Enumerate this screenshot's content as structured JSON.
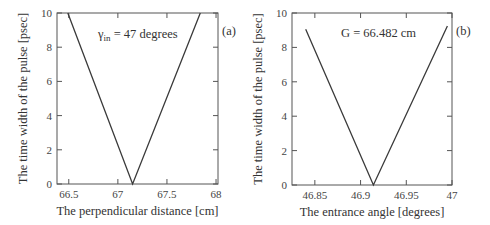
{
  "chart_data": [
    {
      "type": "line",
      "panel_label": "(a)",
      "title": "",
      "annotation": {
        "symbol": "γ",
        "subscript": "in",
        "text": " = 47 degrees"
      },
      "xlabel": "The perpendicular distance [cm]",
      "ylabel": "The time width of the pulse [psec]",
      "xlim": [
        66.38,
        68.02
      ],
      "ylim": [
        0,
        10
      ],
      "xticks": [
        66.5,
        67,
        67.5,
        68
      ],
      "xtick_labels": [
        "66.5",
        "67",
        "67.5",
        "68"
      ],
      "yticks": [
        0,
        2,
        4,
        6,
        8,
        10
      ],
      "ytick_labels": [
        "0",
        "2",
        "4",
        "6",
        "8",
        "10"
      ],
      "grid": false,
      "series": [
        {
          "name": "pulse width",
          "x": [
            66.49,
            67.15,
            67.84
          ],
          "y": [
            10,
            0,
            10
          ]
        }
      ]
    },
    {
      "type": "line",
      "panel_label": "(b)",
      "title": "",
      "annotation": {
        "text": "G = 66.482 cm"
      },
      "xlabel": "The entrance angle [degrees]",
      "ylabel": "The time width of the pulse [psec]",
      "xlim": [
        46.825,
        47.0
      ],
      "ylim": [
        0,
        10
      ],
      "xticks": [
        46.85,
        46.9,
        46.95,
        47
      ],
      "xtick_labels": [
        "46.85",
        "46.9",
        "46.95",
        "47"
      ],
      "yticks": [
        0,
        2,
        4,
        6,
        8,
        10
      ],
      "ytick_labels": [
        "0",
        "2",
        "4",
        "6",
        "8",
        "10"
      ],
      "grid": false,
      "series": [
        {
          "name": "pulse width",
          "x": [
            46.84,
            46.914,
            46.995
          ],
          "y": [
            9.05,
            0,
            9.25
          ]
        }
      ]
    }
  ],
  "panels": [
    {
      "id": "a",
      "frame": {
        "x0": 57,
        "x1": 218,
        "y0": 13,
        "y1": 184
      },
      "annot_pos": {
        "x": 98,
        "y": 38
      },
      "label_pos": {
        "x": 222,
        "y": 35
      }
    },
    {
      "id": "b",
      "frame": {
        "x0": 292,
        "x1": 452,
        "y0": 13,
        "y1": 185
      },
      "annot_pos": {
        "x": 341,
        "y": 37
      },
      "label_pos": {
        "x": 456,
        "y": 35
      }
    }
  ],
  "colors": {
    "line": "#3a3a3a",
    "frame": "#555555",
    "text": "#333333"
  }
}
